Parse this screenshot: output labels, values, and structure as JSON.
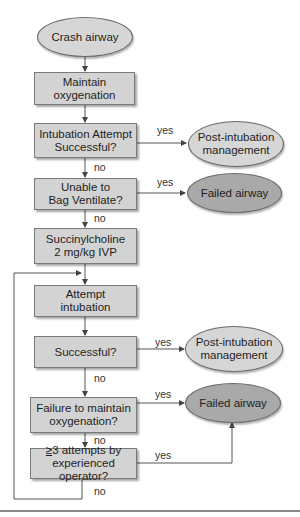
{
  "diagram": {
    "type": "flowchart",
    "nodes": {
      "start": "Crash airway",
      "maintain_oxygenation": "Maintain oxygenation",
      "intubation_attempt": "Intubation Attempt Successful?",
      "post_intubation_1": "Post-intubation management",
      "unable_to_bag": "Unable to Bag Ventilate?",
      "failed_airway_1": "Failed airway",
      "succinylcholine": "Succinylcholine 2 mg/kg IVP",
      "attempt_intubation": "Attempt intubation",
      "successful": "Successful?",
      "post_intubation_2": "Post-intubation management",
      "failure_oxygenation": "Failure to maintain oxygenation?",
      "failed_airway_2": "Failed airway",
      "three_attempts": "≥3 attempts by experienced operator?"
    },
    "lines": {
      "maintain_1": "Maintain",
      "maintain_2": "oxygenation",
      "intub_1": "Intubation Attempt",
      "intub_2": "Successful?",
      "post_1": "Post-intubation",
      "post_2": "management",
      "bag_1": "Unable to",
      "bag_2": "Bag Ventilate?",
      "succ_1": "Succinylcholine",
      "succ_2": "2 mg/kg IVP",
      "attempt_1": "Attempt",
      "attempt_2": "intubation",
      "fail_ox_1": "Failure to maintain",
      "fail_ox_2": "oxygenation?",
      "three_sym": "≥",
      "three_1": "3 attempts by",
      "three_2": "experienced operator?"
    },
    "edge_labels": {
      "yes": "yes",
      "no": "no"
    },
    "colors": {
      "box_fill": "#d3d3d3",
      "light_oval": "#d6d6d6",
      "dark_oval": "#a9a9a9",
      "line": "#555555"
    }
  }
}
